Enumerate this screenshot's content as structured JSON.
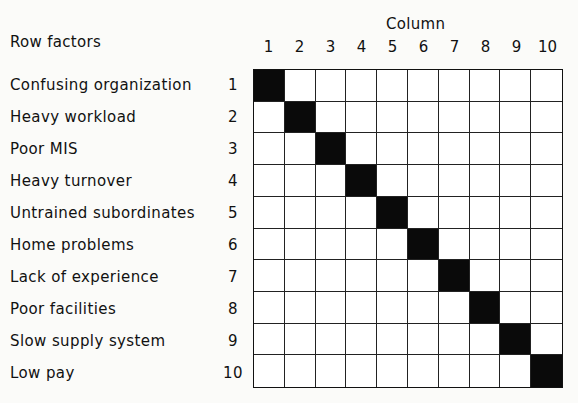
{
  "row_header": "Row factors",
  "column_header": "Column",
  "columns": [
    "1",
    "2",
    "3",
    "4",
    "5",
    "6",
    "7",
    "8",
    "9",
    "10"
  ],
  "rows": [
    {
      "num": "1",
      "label": "Confusing organization"
    },
    {
      "num": "2",
      "label": "Heavy workload"
    },
    {
      "num": "3",
      "label": "Poor MIS"
    },
    {
      "num": "4",
      "label": "Heavy turnover"
    },
    {
      "num": "5",
      "label": "Untrained subordinates"
    },
    {
      "num": "6",
      "label": "Home problems"
    },
    {
      "num": "7",
      "label": "Lack of experience"
    },
    {
      "num": "8",
      "label": "Poor facilities"
    },
    {
      "num": "9",
      "label": "Slow supply system"
    },
    {
      "num": "10",
      "label": "Low pay"
    }
  ],
  "matrix": [
    [
      1,
      0,
      0,
      0,
      0,
      0,
      0,
      0,
      0,
      0
    ],
    [
      0,
      1,
      0,
      0,
      0,
      0,
      0,
      0,
      0,
      0
    ],
    [
      0,
      0,
      1,
      0,
      0,
      0,
      0,
      0,
      0,
      0
    ],
    [
      0,
      0,
      0,
      1,
      0,
      0,
      0,
      0,
      0,
      0
    ],
    [
      0,
      0,
      0,
      0,
      1,
      0,
      0,
      0,
      0,
      0
    ],
    [
      0,
      0,
      0,
      0,
      0,
      1,
      0,
      0,
      0,
      0
    ],
    [
      0,
      0,
      0,
      0,
      0,
      0,
      1,
      0,
      0,
      0
    ],
    [
      0,
      0,
      0,
      0,
      0,
      0,
      0,
      1,
      0,
      0
    ],
    [
      0,
      0,
      0,
      0,
      0,
      0,
      0,
      0,
      1,
      0
    ],
    [
      0,
      0,
      0,
      0,
      0,
      0,
      0,
      0,
      0,
      1
    ]
  ],
  "colors": {
    "filled": "#0a0a0a",
    "empty": "#ffffff"
  }
}
